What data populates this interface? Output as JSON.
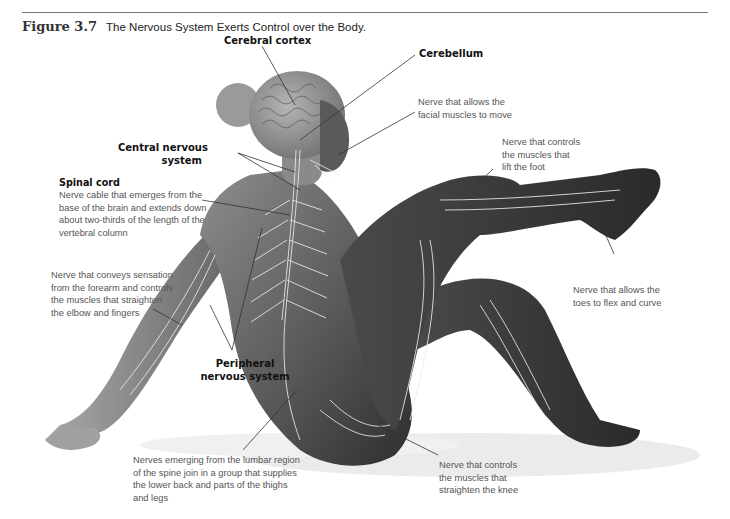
{
  "caption": {
    "figure_number": "Figure 3.7",
    "title": "The Nervous System Exerts Control over the Body."
  },
  "labels": {
    "cerebral_cortex": {
      "title": "Cerebral cortex"
    },
    "cerebellum": {
      "title": "Cerebellum"
    },
    "central_nervous_system": {
      "lines": [
        "Central nervous",
        "system"
      ]
    },
    "spinal_cord": {
      "title": "Spinal cord",
      "lines": [
        "Nerve cable that emerges from the",
        "base of the brain and extends down",
        "about two-thirds of the length of the",
        "vertebral column"
      ]
    },
    "facial_nerve": {
      "lines": [
        "Nerve that allows the",
        "facial muscles to move"
      ]
    },
    "foot_lift_nerve": {
      "lines": [
        "Nerve that controls",
        "the muscles that",
        "lift the foot"
      ]
    },
    "forearm_nerve": {
      "lines": [
        "Nerve that conveys sensation",
        "from the forearm and controls",
        "the muscles that straighten",
        "the elbow and fingers"
      ]
    },
    "toes_nerve": {
      "lines": [
        "Nerve that allows the",
        "toes to flex and curve"
      ]
    },
    "peripheral_nervous_system": {
      "lines": [
        "Peripheral",
        "nervous system"
      ]
    },
    "lumbar_nerves": {
      "lines": [
        "Nerves emerging from the lumbar region",
        "of the spine join in a group that supplies",
        "the lower back and parts of the thighs",
        "and legs"
      ]
    },
    "knee_nerve": {
      "lines": [
        "Nerve that controls",
        "the muscles that",
        "straighten the knee"
      ]
    }
  },
  "colors": {
    "skin_dark": "#3a3a3a",
    "skin_mid": "#6b6b6b",
    "skin_light": "#9a9a9a",
    "nerve": "#e8e8e8",
    "leader_line": "#333333",
    "shadow": "#e6e6e6"
  }
}
